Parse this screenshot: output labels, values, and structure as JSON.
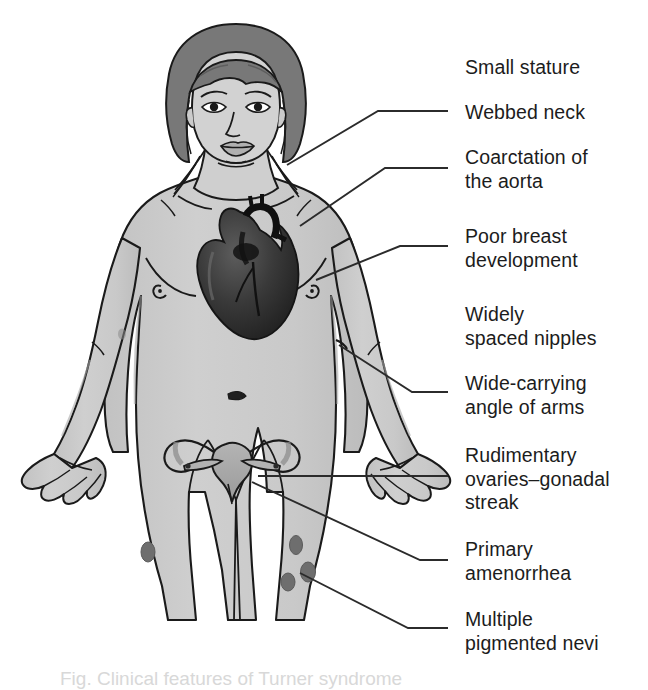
{
  "figure": {
    "style": "grayscale-line-drawing",
    "colors": {
      "background": "#ffffff",
      "skin_fill": "#cbcbcb",
      "skin_shadow": "#b6b6b6",
      "outline": "#1a1a1a",
      "hair": "#787878",
      "hair_dark": "#5e5e5e",
      "heart_dark": "#242424",
      "heart_mid": "#3c3c3c",
      "heart_light": "#585858",
      "uterus_fill": "#a9a9a9",
      "uterus_shadow": "#8f8f8f",
      "nevus": "#6e6e6e",
      "leader_line": "#2b2b2b",
      "label_text": "#1c1c1c"
    },
    "anatomy_parts": [
      "head",
      "hair",
      "face",
      "eyes",
      "nose",
      "mouth",
      "webbed-neck",
      "shoulders",
      "torso",
      "breasts",
      "nipples",
      "navel",
      "left-arm",
      "right-arm",
      "hands",
      "hips",
      "thighs",
      "heart",
      "uterus",
      "fallopian-tubes",
      "ovaries",
      "pigmented-nevi"
    ]
  },
  "callouts": [
    {
      "id": "small-stature",
      "text": "Small stature",
      "top": 56,
      "has_leader": false
    },
    {
      "id": "webbed-neck",
      "text": "Webbed neck",
      "top": 101,
      "has_leader": true
    },
    {
      "id": "coarctation-of-the-aorta",
      "text": "Coarctation of\nthe aorta",
      "top": 146,
      "has_leader": true
    },
    {
      "id": "poor-breast-development",
      "text": "Poor breast\ndevelopment",
      "top": 225,
      "has_leader": true
    },
    {
      "id": "widely-spaced-nipples",
      "text": "Widely\nspaced nipples",
      "top": 303,
      "has_leader": false
    },
    {
      "id": "wide-carrying-angle-of-arms",
      "text": "Wide-carrying\nangle of arms",
      "top": 372,
      "has_leader": true
    },
    {
      "id": "rudimentary-ovaries-gonadal-streak",
      "text": "Rudimentary\novaries–gonadal\nstreak",
      "top": 444,
      "has_leader": true
    },
    {
      "id": "primary-amenorrhea",
      "text": "Primary\namenorrhea",
      "top": 538,
      "has_leader": true
    },
    {
      "id": "multiple-pigmented-nevi",
      "text": "Multiple\npigmented nevi",
      "top": 608,
      "has_leader": true
    }
  ],
  "bottom_caption": {
    "text": "Fig. Clinical features of Turner syndrome"
  }
}
